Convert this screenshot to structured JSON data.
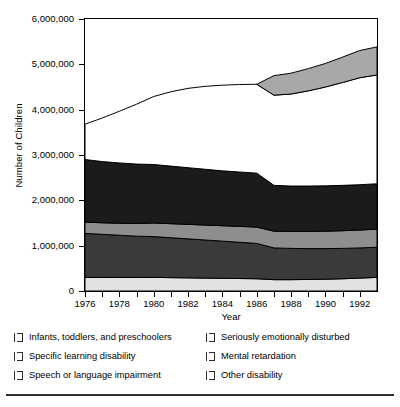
{
  "chart_data": {
    "type": "area",
    "title": "",
    "xlabel": "Year",
    "ylabel": "Number of Children",
    "xlim": [
      1976,
      1993
    ],
    "ylim": [
      0,
      6000000
    ],
    "grid": false,
    "stacked": true,
    "legend_position": "bottom",
    "x_tick_labels": [
      "1976",
      "1978",
      "1980",
      "1982",
      "1984",
      "1986",
      "1988",
      "1990",
      "1992"
    ],
    "x_ticks": [
      1976,
      1977,
      1978,
      1979,
      1980,
      1981,
      1982,
      1983,
      1984,
      1985,
      1986,
      1987,
      1988,
      1989,
      1990,
      1991,
      1992
    ],
    "y_tick_labels": [
      "0",
      "1,000,000",
      "2,000,000",
      "3,000,000",
      "4,000,000",
      "5,000,000",
      "6,000,000"
    ],
    "y_ticks": [
      0,
      1000000,
      2000000,
      3000000,
      4000000,
      5000000,
      6000000
    ],
    "x": [
      1976,
      1977,
      1978,
      1979,
      1980,
      1981,
      1982,
      1983,
      1984,
      1985,
      1986,
      1987,
      1988,
      1989,
      1990,
      1991,
      1992,
      1993
    ],
    "series": [
      {
        "name": "Other disability",
        "color": "#e2e2e2",
        "values": [
          300000,
          300000,
          300000,
          300000,
          300000,
          295000,
          290000,
          285000,
          280000,
          275000,
          270000,
          250000,
          250000,
          255000,
          260000,
          270000,
          285000,
          300000
        ]
      },
      {
        "name": "Mental retardation",
        "color": "#3a3a3a",
        "values": [
          970000,
          950000,
          930000,
          910000,
          900000,
          880000,
          860000,
          840000,
          820000,
          800000,
          780000,
          700000,
          690000,
          680000,
          675000,
          670000,
          665000,
          665000
        ]
      },
      {
        "name": "Seriously emotionally disturbed",
        "color": "#8e8e8e",
        "values": [
          250000,
          255000,
          265000,
          280000,
          300000,
          310000,
          320000,
          330000,
          340000,
          350000,
          360000,
          370000,
          375000,
          380000,
          385000,
          390000,
          395000,
          400000
        ]
      },
      {
        "name": "Speech or language impairment",
        "color": "#1b1b1b",
        "values": [
          1380000,
          1350000,
          1330000,
          1310000,
          1290000,
          1270000,
          1250000,
          1230000,
          1210000,
          1200000,
          1190000,
          1010000,
          1000000,
          1000000,
          1000000,
          1000000,
          1000000,
          1000000
        ]
      },
      {
        "name": "Specific learning disability",
        "color": "#ffffff",
        "values": [
          780000,
          960000,
          1140000,
          1320000,
          1500000,
          1640000,
          1750000,
          1830000,
          1890000,
          1930000,
          1960000,
          1990000,
          2030000,
          2100000,
          2180000,
          2270000,
          2360000,
          2400000
        ]
      },
      {
        "name": "Infants, toddlers, and preschoolers",
        "color": "#a8a8a8",
        "values": [
          0,
          0,
          0,
          0,
          0,
          0,
          0,
          0,
          0,
          0,
          0,
          430000,
          460000,
          490000,
          520000,
          560000,
          600000,
          620000
        ],
        "starts_at": 1986
      }
    ],
    "total_top_line": [
      3680000,
      3815000,
      3965000,
      4120000,
      4290000,
      4395000,
      4470000,
      4515000,
      4540000,
      4555000,
      4560000,
      4750000,
      4805000,
      4905000,
      5020000,
      5160000,
      5305000,
      5385000
    ]
  },
  "legend": {
    "items": [
      {
        "label": "Infants, toddlers, and preschoolers",
        "color": "#a8a8a8",
        "column": "left"
      },
      {
        "label": "Specific learning disability",
        "color": "#ffffff",
        "column": "left"
      },
      {
        "label": "Speech or language impairment",
        "color": "#1b1b1b",
        "column": "left"
      },
      {
        "label": "Seriously emotionally disturbed",
        "color": "#8e8e8e",
        "column": "right"
      },
      {
        "label": "Mental retardation",
        "color": "#3a3a3a",
        "column": "right"
      },
      {
        "label": "Other disability",
        "color": "#e2e2e2",
        "column": "right"
      }
    ]
  }
}
